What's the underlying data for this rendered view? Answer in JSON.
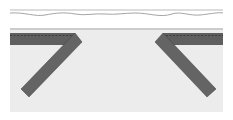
{
  "diagram": {
    "colors": {
      "background": "#ffffff",
      "fabric_panel": "#ececec",
      "strip": "#5f5f5f",
      "strip_edge": "#3a3a3a",
      "stitch": "#2e2e2e",
      "line": "#9a9a9a"
    },
    "elements": {
      "top_edge_line": {
        "y": 10
      },
      "wavy_cut_line": {
        "y": 14
      },
      "fold_line": {
        "y": 29
      },
      "fabric_panel": {
        "x": 10,
        "y": 30,
        "width": 213,
        "height": 82
      },
      "left_strip": {
        "horizontal": true,
        "diagonal": true
      },
      "right_strip": {
        "horizontal": true,
        "diagonal": true
      }
    }
  }
}
